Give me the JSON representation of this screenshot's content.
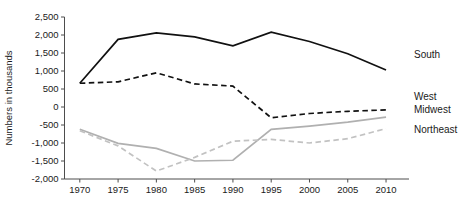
{
  "chart_data": {
    "type": "line",
    "title": "",
    "xlabel": "",
    "ylabel": "Numbers in thousands",
    "x": [
      1970,
      1975,
      1980,
      1985,
      1990,
      1995,
      2000,
      2005,
      2010
    ],
    "xticks": [
      "1970",
      "1975",
      "1980",
      "1985",
      "1990",
      "1995",
      "2000",
      "2005",
      "2010"
    ],
    "yticks": [
      "2,500",
      "2,000",
      "1,500",
      "1,000",
      "500",
      "0",
      "-500",
      "-1,000",
      "-1,500",
      "-2,000"
    ],
    "ytick_values": [
      2500,
      2000,
      1500,
      1000,
      500,
      0,
      -500,
      -1000,
      -1500,
      -2000
    ],
    "xlim": [
      1968,
      2013
    ],
    "ylim": [
      -2000,
      2500
    ],
    "grid": false,
    "legend_position": "right-inline",
    "series": [
      {
        "name": "South",
        "label": "South",
        "color": "#111111",
        "style": "solid",
        "width": 1.7,
        "values": [
          660,
          1880,
          2060,
          1950,
          1700,
          2080,
          1820,
          1480,
          1030
        ]
      },
      {
        "name": "West",
        "label": "West",
        "color": "#111111",
        "style": "dashed",
        "width": 1.7,
        "values": [
          660,
          700,
          950,
          640,
          580,
          -300,
          -180,
          -120,
          -80
        ]
      },
      {
        "name": "Midwest",
        "label": "Midwest",
        "color": "#b0b0b0",
        "style": "solid",
        "width": 1.7,
        "values": [
          -620,
          -1010,
          -1150,
          -1500,
          -1480,
          -620,
          -530,
          -420,
          -280
        ]
      },
      {
        "name": "Northeast",
        "label": "Northeast",
        "color": "#c2c2c2",
        "style": "dashed",
        "width": 1.7,
        "values": [
          -660,
          -1080,
          -1780,
          -1400,
          -950,
          -900,
          -1000,
          -880,
          -600
        ]
      }
    ]
  }
}
